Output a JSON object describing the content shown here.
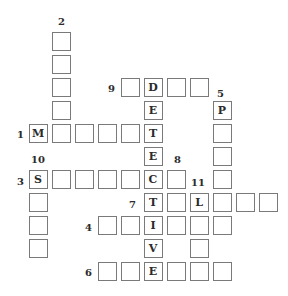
{
  "puzzle": {
    "type": "crossword",
    "grid": {
      "origin_x": 29.5,
      "origin_y": 33,
      "pitch": 23
    },
    "cells": [
      {
        "row": 0,
        "col": 1,
        "letter": ""
      },
      {
        "row": 1,
        "col": 1,
        "letter": ""
      },
      {
        "row": 2,
        "col": 1,
        "letter": ""
      },
      {
        "row": 3,
        "col": 1,
        "letter": ""
      },
      {
        "row": 2,
        "col": 4,
        "letter": ""
      },
      {
        "row": 2,
        "col": 5,
        "letter": "D"
      },
      {
        "row": 2,
        "col": 6,
        "letter": ""
      },
      {
        "row": 2,
        "col": 7,
        "letter": ""
      },
      {
        "row": 3,
        "col": 5,
        "letter": "E"
      },
      {
        "row": 3,
        "col": 8,
        "letter": "P"
      },
      {
        "row": 4,
        "col": 0,
        "letter": "M"
      },
      {
        "row": 4,
        "col": 1,
        "letter": ""
      },
      {
        "row": 4,
        "col": 2,
        "letter": ""
      },
      {
        "row": 4,
        "col": 3,
        "letter": ""
      },
      {
        "row": 4,
        "col": 4,
        "letter": ""
      },
      {
        "row": 4,
        "col": 5,
        "letter": "T"
      },
      {
        "row": 4,
        "col": 8,
        "letter": ""
      },
      {
        "row": 5,
        "col": 5,
        "letter": "E"
      },
      {
        "row": 5,
        "col": 8,
        "letter": ""
      },
      {
        "row": 6,
        "col": 0,
        "letter": "S"
      },
      {
        "row": 6,
        "col": 1,
        "letter": ""
      },
      {
        "row": 6,
        "col": 2,
        "letter": ""
      },
      {
        "row": 6,
        "col": 3,
        "letter": ""
      },
      {
        "row": 6,
        "col": 4,
        "letter": ""
      },
      {
        "row": 6,
        "col": 5,
        "letter": "C"
      },
      {
        "row": 6,
        "col": 6,
        "letter": ""
      },
      {
        "row": 6,
        "col": 8,
        "letter": ""
      },
      {
        "row": 7,
        "col": 0,
        "letter": ""
      },
      {
        "row": 7,
        "col": 5,
        "letter": "T"
      },
      {
        "row": 7,
        "col": 6,
        "letter": ""
      },
      {
        "row": 7,
        "col": 7,
        "letter": "L"
      },
      {
        "row": 7,
        "col": 8,
        "letter": ""
      },
      {
        "row": 7,
        "col": 9,
        "letter": ""
      },
      {
        "row": 7,
        "col": 10,
        "letter": ""
      },
      {
        "row": 8,
        "col": 0,
        "letter": ""
      },
      {
        "row": 8,
        "col": 3,
        "letter": ""
      },
      {
        "row": 8,
        "col": 4,
        "letter": ""
      },
      {
        "row": 8,
        "col": 5,
        "letter": "I"
      },
      {
        "row": 8,
        "col": 6,
        "letter": ""
      },
      {
        "row": 8,
        "col": 7,
        "letter": ""
      },
      {
        "row": 8,
        "col": 8,
        "letter": ""
      },
      {
        "row": 9,
        "col": 0,
        "letter": ""
      },
      {
        "row": 9,
        "col": 5,
        "letter": "V"
      },
      {
        "row": 9,
        "col": 7,
        "letter": ""
      },
      {
        "row": 10,
        "col": 3,
        "letter": ""
      },
      {
        "row": 10,
        "col": 4,
        "letter": ""
      },
      {
        "row": 10,
        "col": 5,
        "letter": "E"
      },
      {
        "row": 10,
        "col": 6,
        "letter": ""
      },
      {
        "row": 10,
        "col": 7,
        "letter": ""
      },
      {
        "row": 10,
        "col": 8,
        "letter": ""
      }
    ],
    "clue_numbers": [
      {
        "number": "2",
        "x": 58,
        "y": 17
      },
      {
        "number": "9",
        "x": 108,
        "y": 84
      },
      {
        "number": "5",
        "x": 217,
        "y": 89
      },
      {
        "number": "1",
        "x": 17,
        "y": 130
      },
      {
        "number": "10",
        "x": 31,
        "y": 155
      },
      {
        "number": "8",
        "x": 174,
        "y": 155
      },
      {
        "number": "3",
        "x": 17,
        "y": 177
      },
      {
        "number": "11",
        "x": 191,
        "y": 178
      },
      {
        "number": "7",
        "x": 129,
        "y": 200
      },
      {
        "number": "4",
        "x": 85,
        "y": 223
      },
      {
        "number": "6",
        "x": 85,
        "y": 268
      }
    ],
    "entries": {
      "across": [
        {
          "number": "1",
          "length": 6,
          "given": "M____T"
        },
        {
          "number": "3",
          "length": 7,
          "given": "S____C_"
        },
        {
          "number": "4",
          "length": 6,
          "given": "__I___"
        },
        {
          "number": "6",
          "length": 6,
          "given": "__E___"
        },
        {
          "number": "7",
          "length": 6,
          "given": "T_L___"
        },
        {
          "number": "9",
          "length": 4,
          "given": "_D__"
        }
      ],
      "down": [
        {
          "number": "2",
          "length": 5,
          "given": "_____"
        },
        {
          "number": "5",
          "length": 6,
          "given": "P_____"
        },
        {
          "number": "8",
          "length": 3,
          "given": "___"
        },
        {
          "number": "10",
          "length": 4,
          "given": "S___"
        },
        {
          "number": "11",
          "length": 4,
          "given": "L___"
        },
        {
          "number": "answer",
          "length": 9,
          "given": "DETECTIVE"
        }
      ]
    },
    "colors": {
      "cell_border": "#7a7a7a",
      "text": "#2b2b2b",
      "background": "#ffffff"
    }
  }
}
